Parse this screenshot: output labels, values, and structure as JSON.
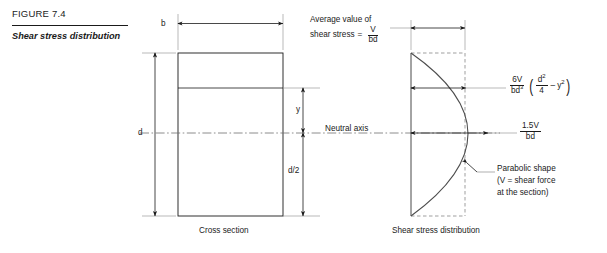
{
  "figure": {
    "number": "FIGURE 7.4",
    "title": "Shear stress distribution"
  },
  "dimensions": {
    "width_label": "b",
    "depth_label": "d",
    "y_label": "y",
    "half_depth_label": "d/2"
  },
  "annotations": {
    "neutral_axis": "Neutral axis",
    "average_line1": "Average value of",
    "average_line2": "shear stress",
    "average_equals": "=",
    "average_numerator": "V",
    "average_denominator": "bd",
    "parabolic_note_line1": "Parabolic shape",
    "parabolic_note_line2": "(V = shear force",
    "parabolic_note_line3": "at the section)"
  },
  "captions": {
    "left": "Cross section",
    "right": "Shear stress distribution"
  },
  "formulas": {
    "parabolic": {
      "numerator": "6V",
      "denominator_base": "bd",
      "denominator_exp": "3",
      "open_paren": "(",
      "inner_numerator_base": "d",
      "inner_numerator_exp": "2",
      "inner_denominator": "4",
      "minus": "–",
      "inner_term_base": "y",
      "inner_term_exp": "2",
      "close_paren": ")"
    },
    "maximum": {
      "numerator": "1.5V",
      "denominator": "bd"
    }
  },
  "colors": {
    "line": "#1a1a1a",
    "text": "#1a1a1a",
    "background": "#ffffff"
  }
}
